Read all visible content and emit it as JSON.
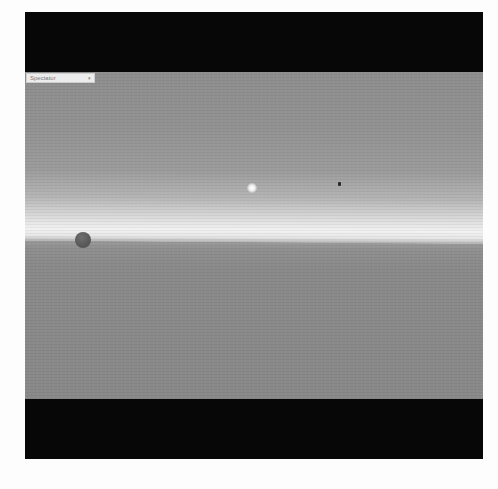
{
  "viewport": {
    "camera_mode_dropdown": {
      "selected": "Spectator",
      "arrow": "chevron-down"
    },
    "scene": {
      "sky_color": "#929292",
      "horizon_glow_color": "#f2f2f2",
      "ground_color": "#8a8a8a",
      "objects": [
        {
          "type": "sphere",
          "color": "#5a5a5a"
        },
        {
          "type": "sun",
          "color": "#ffffff"
        },
        {
          "type": "marker",
          "color": "#2a2a2a"
        }
      ]
    },
    "letterbox_color": "#070707"
  },
  "caption": {
    "left": "",
    "right": ""
  }
}
